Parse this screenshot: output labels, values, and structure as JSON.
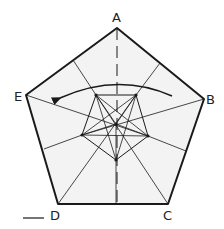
{
  "figure": {
    "type": "geometric-diagram",
    "colors": {
      "fill": "#f3f3f3",
      "stroke": "#1a1a1a",
      "background": "#ffffff"
    },
    "vertices": [
      {
        "label": "A",
        "x": 117,
        "y": 28
      },
      {
        "label": "B",
        "x": 204,
        "y": 99
      },
      {
        "label": "C",
        "x": 168,
        "y": 204
      },
      {
        "label": "D",
        "x": 58,
        "y": 204
      },
      {
        "label": "E",
        "x": 26,
        "y": 95
      }
    ],
    "labels": {
      "A": "A",
      "B": "B",
      "C": "C",
      "D": "D",
      "E": "E"
    },
    "center": {
      "x": 116,
      "y": 124
    },
    "inner_pentagon": [
      {
        "x": 96,
        "y": 95
      },
      {
        "x": 136,
        "y": 95
      },
      {
        "x": 148,
        "y": 136
      },
      {
        "x": 116,
        "y": 160
      },
      {
        "x": 82,
        "y": 135
      }
    ],
    "rotation_arrow": {
      "direction": "counter-clockwise",
      "from": {
        "x": 172,
        "y": 96
      },
      "to": {
        "x": 56,
        "y": 98
      }
    },
    "axis": {
      "style": "dashed",
      "through": "A"
    }
  }
}
